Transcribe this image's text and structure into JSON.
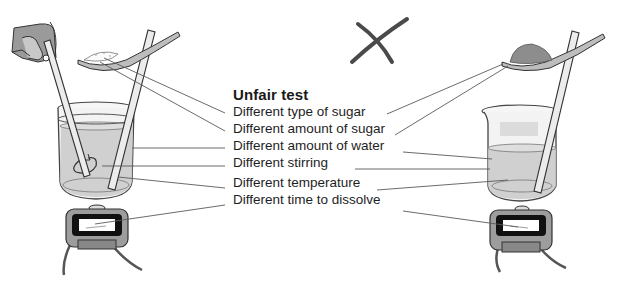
{
  "figure": {
    "title": "Unfair test",
    "verdict_mark": "cross-mark",
    "labels": [
      {
        "text": "Different type of sugar",
        "top": 18
      },
      {
        "text": "Different amount of sugar",
        "top": 35
      },
      {
        "text": "Different amount of water",
        "top": 52
      },
      {
        "text": "Different stirring",
        "top": 69
      },
      {
        "text": "Different temperature",
        "top": 89
      },
      {
        "text": "Different time to dissolve",
        "top": 106
      }
    ],
    "left_setup": {
      "description": "Beaker with stirring rod held by hand, spoon of fine white sugar, stirring motion, stopwatch"
    },
    "right_setup": {
      "description": "Beaker with less water and one rod, spoon heaped with coarse brown sugar, stopwatch"
    },
    "colors": {
      "ink": "#1e1e1e",
      "line": "#5a5a5a",
      "water": "#bdbdbd",
      "glass": "#f4f4f4",
      "rod": "#e8e8e8",
      "brown_sugar": "#8a8a8a",
      "cross": "#4a4a4a"
    }
  }
}
